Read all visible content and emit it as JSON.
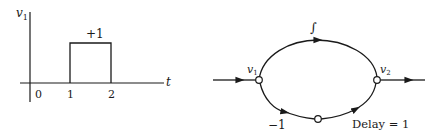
{
  "left_plot": {
    "y_axis_label": "v",
    "y_axis_sub": "1",
    "x_axis_label": "t",
    "ticks": [
      "0",
      "1",
      "2"
    ],
    "pulse_label": "+1"
  },
  "flow_graph": {
    "node_in_label": "v",
    "node_in_sub": "1",
    "node_out_label": "v",
    "node_out_sub": "2",
    "upper_branch_label": "∫",
    "lower_branch_gain": "−1",
    "delay_label": "Delay = 1"
  },
  "colors": {
    "ink": "#1a1a1a",
    "background": "#ffffff"
  }
}
